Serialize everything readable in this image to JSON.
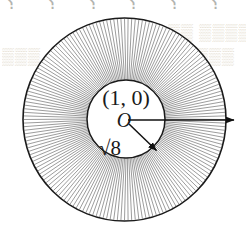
{
  "figure": {
    "name": "annulus-radial-hatch-diagram",
    "canvas": {
      "width": 246,
      "height": 229,
      "background": "#ffffff"
    },
    "geometry": {
      "center": {
        "x": 124.5,
        "y": 119.5
      },
      "outer_circle": {
        "radius": 101.5,
        "stroke": "#1a1a1a",
        "stroke_width": 1.6,
        "fill": "#ffffff"
      },
      "inner_circle": {
        "radius": 39.0,
        "center_x": 126,
        "center_y": 119,
        "stroke": "#1a1a1a",
        "stroke_width": 1.5,
        "fill": "#ffffff"
      },
      "hatching": {
        "description": "radial line segments filling the annulus between the inner and outer circles",
        "line_count": 176,
        "stroke": "#4a4a4a",
        "stroke_width": 0.55,
        "start_angle_deg": 0,
        "sweep_deg": 360
      }
    },
    "labels": {
      "point": "(1, 0)",
      "origin": "O",
      "radius_value": "√8"
    },
    "arrows": {
      "horizontal": {
        "name": "horizontal-radius-arrow",
        "from": {
          "x": 128,
          "y": 120
        },
        "to": {
          "x": 236,
          "y": 120
        },
        "stroke": "#111111",
        "stroke_width": 1.5,
        "direction": "right"
      },
      "diagonal": {
        "name": "diagonal-radius-arrow",
        "from": {
          "x": 129,
          "y": 124
        },
        "to": {
          "x": 158,
          "y": 152
        },
        "stroke": "#111111",
        "stroke_width": 1.5,
        "direction": "down-right",
        "angle_deg": 44
      }
    },
    "ghost_text": {
      "top_row": "⸮ ⸮ ⸮ ⸮ ⸮ ⸮",
      "right_upper": "▒▒ ▒▒▒▒▒",
      "left_mid": "▒▒▒",
      "right_mid": "▒▒▒"
    }
  },
  "chart_data": {
    "type": "diagram",
    "shapes": [
      {
        "kind": "circle",
        "role": "outer-boundary",
        "cx": 124.5,
        "cy": 119.5,
        "r": 101.5
      },
      {
        "kind": "circle",
        "role": "inner-boundary",
        "cx": 126.0,
        "cy": 119.0,
        "r": 39.0
      },
      {
        "kind": "radial-hatch",
        "role": "annulus-fill",
        "count": 176,
        "r_inner": 39.0,
        "r_outer": 101.5
      },
      {
        "kind": "arrow",
        "role": "outer-radius-vector",
        "x1": 128,
        "y1": 120,
        "x2": 236,
        "y2": 120
      },
      {
        "kind": "arrow",
        "role": "inner-radius-vector",
        "x1": 129,
        "y1": 124,
        "x2": 158,
        "y2": 152
      }
    ],
    "annotations": [
      {
        "text": "(1, 0)",
        "x": 126,
        "y": 100,
        "role": "point-coordinate-label"
      },
      {
        "text": "O",
        "x": 124,
        "y": 124,
        "role": "origin-label"
      },
      {
        "text": "√8",
        "x": 108,
        "y": 152,
        "role": "radius-length-label"
      }
    ]
  }
}
